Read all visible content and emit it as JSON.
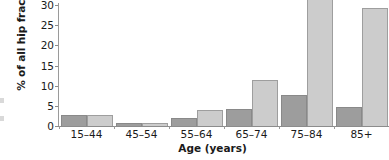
{
  "chart_data": {
    "type": "bar",
    "title": "",
    "xlabel": "Age (years)",
    "ylabel": "% of all hip fractures",
    "categories": [
      "15–44",
      "45–54",
      "55–64",
      "65–74",
      "75–84",
      "85+"
    ],
    "series": [
      {
        "name": "series-1",
        "color": "#9d9d9d",
        "values": [
          2.8,
          0.7,
          1.9,
          4.3,
          7.7,
          4.6
        ]
      },
      {
        "name": "series-2",
        "color": "#cccccc",
        "values": [
          2.8,
          0.7,
          3.9,
          11.4,
          34.5,
          29.2
        ]
      }
    ],
    "ylim": [
      0,
      30
    ],
    "yticks": [
      0,
      5,
      10,
      15,
      20,
      25,
      30
    ],
    "ytick_labels": [
      "0",
      "5",
      "10",
      "15",
      "20",
      "25",
      "30"
    ],
    "grid": false,
    "legend": "none"
  },
  "axes": {
    "y_title": "% of all hip fractures",
    "x_title": "Age (years)"
  },
  "colors": {
    "series_1": "#9d9d9d",
    "series_2": "#cccccc",
    "axis": "#8c8c8c",
    "text": "#1a1a1a",
    "background": "#ffffff"
  }
}
